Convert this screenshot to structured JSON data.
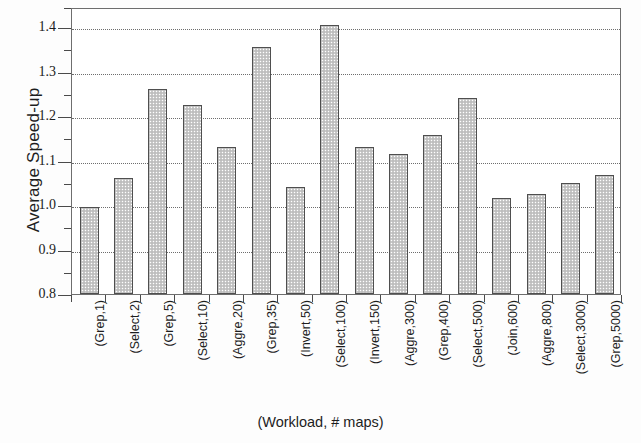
{
  "chart_data": {
    "type": "bar",
    "title": "",
    "xlabel": "(Workload, # maps)",
    "ylabel": "Average Speed-up",
    "categories": [
      "(Grep,1)",
      "(Select,2)",
      "(Grep,5)",
      "(Select,10)",
      "(Aggre,20)",
      "(Grep,35)",
      "(Invert,50)",
      "(Select,100)",
      "(Invert,150)",
      "(Aggre,300)",
      "(Grep,400)",
      "(Select,500)",
      "(Join,600)",
      "(Aggre,800)",
      "(Select,3000)",
      "(Grep,5000)"
    ],
    "values": [
      0.995,
      1.06,
      1.26,
      1.225,
      1.13,
      1.355,
      1.04,
      1.405,
      1.13,
      1.115,
      1.157,
      1.24,
      1.015,
      1.025,
      1.05,
      1.067
    ],
    "ylim": [
      0.8,
      1.445
    ],
    "yticks": [
      0.8,
      0.9,
      1.0,
      1.1,
      1.2,
      1.3,
      1.4
    ],
    "ytick_labels": [
      "0.8",
      "0.9",
      "1.0",
      "1.1",
      "1.2",
      "1.3",
      "1.4"
    ],
    "gridlines": [
      0.9,
      1.0,
      1.1,
      1.2,
      1.3,
      1.4
    ],
    "grid": true,
    "legend": null,
    "bar_fill_color": "#c9c9c9",
    "bar_edge_color": "#4f4f4f",
    "axis_color": "#6e6e6e"
  }
}
